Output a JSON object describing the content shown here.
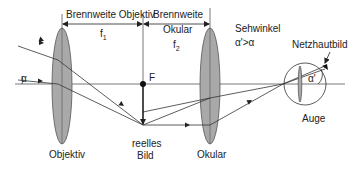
{
  "labels": {
    "focal_objective": "Brennweite Objektiv",
    "f1": "f",
    "f1_sub": "1",
    "focal_ocular_line1": "Brennweite",
    "focal_ocular_line2": "Okular",
    "f2": "f",
    "f2_sub": "2",
    "focal_point": "F",
    "viewing_angle_title": "Sehwinkel",
    "viewing_angle_relation": "α'>α",
    "retina_image": "Netzhautbild",
    "alpha": "α",
    "alpha_prime": "α'",
    "objective": "Objektiv",
    "real_image_line1": "reelles",
    "real_image_line2": "Bild",
    "ocular": "Okular",
    "eye": "Auge"
  },
  "colors": {
    "lens_fill": "#a9a9a9",
    "line": "#333333",
    "background": "#ffffff"
  }
}
